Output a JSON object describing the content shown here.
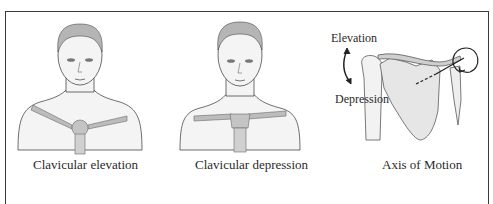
{
  "figure": {
    "panels": [
      {
        "id": "elevation",
        "caption": "Clavicular elevation"
      },
      {
        "id": "depression",
        "caption": "Clavicular depression"
      },
      {
        "id": "axis",
        "caption": "Axis of Motion",
        "labels": {
          "top": "Elevation",
          "bottom": "Depression"
        }
      }
    ],
    "colors": {
      "border": "#3a3a3a",
      "line": "#4a4a4a",
      "skin": "#f3f3f3",
      "hair": "#b8b8b8",
      "bone": "#c9c9c9",
      "clavicle": "#bcbcbc"
    }
  }
}
